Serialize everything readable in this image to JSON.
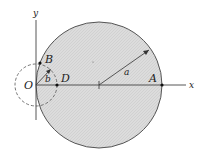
{
  "diagram": {
    "type": "geometry",
    "colors": {
      "fill": "#d8d8d8",
      "stroke": "#555555",
      "axis": "#444444",
      "point": "#111111"
    },
    "axes": {
      "x_label": "x",
      "y_label": "y"
    },
    "origin_label": "O",
    "big_circle": {
      "radius_label": "a",
      "center": [
        99,
        85
      ],
      "r": 63
    },
    "small_circle": {
      "radius_label": "b",
      "center": [
        36,
        85
      ],
      "r": 21,
      "style": "dashed"
    },
    "points": [
      {
        "label": "A",
        "x": 162,
        "y": 85
      },
      {
        "label": "B",
        "x": 40,
        "y": 65
      },
      {
        "label": "D",
        "x": 57,
        "y": 85
      }
    ]
  }
}
